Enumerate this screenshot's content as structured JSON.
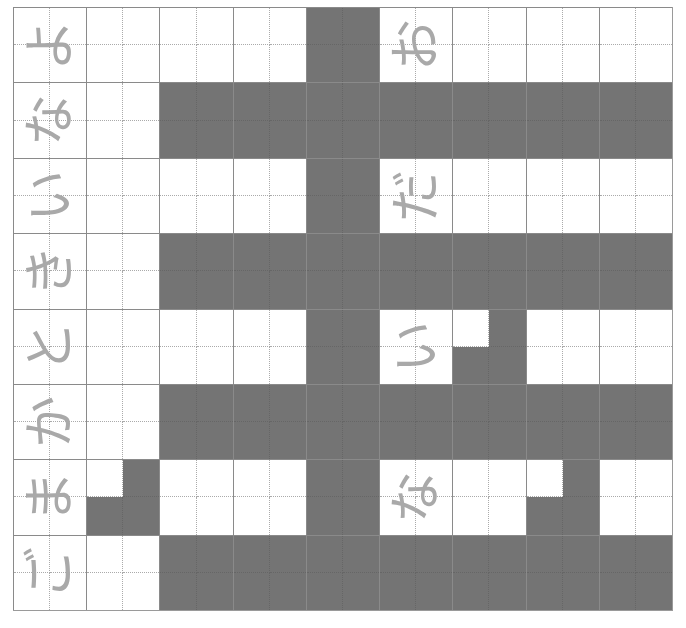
{
  "colors": {
    "dark": "#747474",
    "light": "#ffffff",
    "glyph": "#a9a9a9",
    "grid_line": "#8a8a8a",
    "dotted_line": "#aaaaaa"
  },
  "grid": {
    "columns": 9,
    "rows": 8,
    "cells": [
      [
        {
          "glyph": "よ",
          "q": "WWWW"
        },
        {
          "q": "WWWW"
        },
        {
          "q": "WWWW"
        },
        {
          "q": "WWWW"
        },
        {
          "q": "DDDD"
        },
        {
          "glyph": "お",
          "q": "WWWW"
        },
        {
          "q": "WWWW"
        },
        {
          "q": "WWWW"
        },
        {
          "q": "WWWW"
        }
      ],
      [
        {
          "glyph": "な",
          "q": "WWWW"
        },
        {
          "q": "WWWW"
        },
        {
          "q": "DDDD"
        },
        {
          "q": "DDDD"
        },
        {
          "q": "DDDD"
        },
        {
          "q": "DDDD"
        },
        {
          "q": "DDDD"
        },
        {
          "q": "DDDD"
        },
        {
          "q": "DDDD"
        }
      ],
      [
        {
          "glyph": "い",
          "q": "WWWW"
        },
        {
          "q": "WWWW"
        },
        {
          "q": "WWWW"
        },
        {
          "q": "WWWW"
        },
        {
          "q": "DDDD"
        },
        {
          "glyph": "だ",
          "q": "WWWW"
        },
        {
          "q": "WWWW"
        },
        {
          "q": "WWWW"
        },
        {
          "q": "WWWW"
        }
      ],
      [
        {
          "glyph": "き",
          "q": "WWWW"
        },
        {
          "q": "WWWW"
        },
        {
          "q": "DDDD"
        },
        {
          "q": "DDDD"
        },
        {
          "q": "DDDD"
        },
        {
          "q": "DDDD"
        },
        {
          "q": "DDDD"
        },
        {
          "q": "DDDD"
        },
        {
          "q": "DDDD"
        }
      ],
      [
        {
          "glyph": "と",
          "q": "WWWW"
        },
        {
          "q": "WWWW"
        },
        {
          "q": "WWWW"
        },
        {
          "q": "WWWW"
        },
        {
          "q": "DDDD"
        },
        {
          "glyph": "い",
          "q": "WWWW"
        },
        {
          "q": "WDDD"
        },
        {
          "q": "WWWW"
        },
        {
          "q": "WWWW"
        }
      ],
      [
        {
          "glyph": "か",
          "q": "WWWW"
        },
        {
          "q": "WWWW"
        },
        {
          "q": "DDDD"
        },
        {
          "q": "DDDD"
        },
        {
          "q": "DDDD"
        },
        {
          "q": "DDDD"
        },
        {
          "q": "DDDD"
        },
        {
          "q": "DDDD"
        },
        {
          "q": "DDDD"
        }
      ],
      [
        {
          "glyph": "ま",
          "q": "WWWW"
        },
        {
          "q": "WDDD"
        },
        {
          "q": "WWWW"
        },
        {
          "q": "WWWW"
        },
        {
          "q": "DDDD"
        },
        {
          "glyph": "な",
          "q": "WWWW"
        },
        {
          "q": "WWWW"
        },
        {
          "q": "WDDD"
        },
        {
          "q": "WWWW"
        }
      ],
      [
        {
          "glyph": "ご",
          "q": "WWWW"
        },
        {
          "q": "WWWW"
        },
        {
          "q": "DDDD"
        },
        {
          "q": "DDDD"
        },
        {
          "q": "DDDD"
        },
        {
          "q": "DDDD"
        },
        {
          "q": "DDDD"
        },
        {
          "q": "DDDD"
        },
        {
          "q": "DDDD"
        }
      ]
    ]
  },
  "text_column": {
    "label_glyphs": [
      "よ",
      "な",
      "い",
      "き",
      "と",
      "か",
      "ま",
      "ご"
    ]
  },
  "inner_column": {
    "label_glyphs": [
      "お",
      "だ",
      "い",
      "な"
    ]
  }
}
